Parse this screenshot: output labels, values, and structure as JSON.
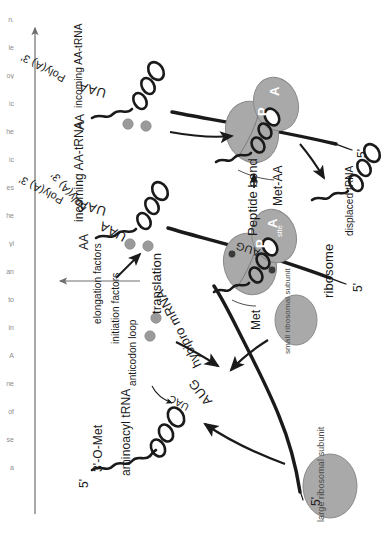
{
  "figure": {
    "domain": "biology-diagram",
    "orientation": "page scanned sideways; figure rotated 90 degrees counter-clockwise",
    "background_color": "#ffffff",
    "ink_color": "#1a1a1a",
    "blob_fill": "#a9a9a9",
    "blob_stroke": "#7d7d7d",
    "factor_dot_color": "#9a9a9a"
  },
  "process_arrow": {
    "label": "translation",
    "direction": "left-to-right, time progresses"
  },
  "panels": [
    {
      "id": "initiation",
      "name": "panel-initiation",
      "mrna": {
        "five_prime": "5'",
        "start_codon": "AUG",
        "name": "hybipro mRNA",
        "stop_codon": "UAA",
        "three_prime": "Poly(A) 3'"
      },
      "labels": [
        "5'",
        "3'-O-Met",
        "aminoacyl tRNA",
        "UAC",
        "anticodon",
        "loop",
        "large ribosomal subunit",
        "small ribosomal subunit",
        "initiation factors"
      ],
      "trna": {
        "acceptor_end": "3'-O-Met",
        "five_prime_end": "5'",
        "anticodon": "UAC",
        "anticodon_loop_label": "anticodon loop",
        "type": "aminoacyl tRNA"
      },
      "large_subunit_label": "large ribosomal subunit",
      "small_subunit_label": "small ribosomal subunit",
      "factors_label": "initiation factors"
    },
    {
      "id": "elongation-binding",
      "name": "panel-elongation-binding",
      "mrna": {
        "five_prime": "5'",
        "start_codon": "AUG",
        "stop_codon": "UAA",
        "three_prime": "Poly(A) 3'"
      },
      "labels": [
        "AA",
        "incoming AA-tRNA",
        "elongation factors",
        "Met",
        "ribosome",
        "P",
        "site",
        "A",
        "site",
        "5'"
      ],
      "ribosome_label": "ribosome",
      "p_site": {
        "letter": "P",
        "sub": "site"
      },
      "a_site": {
        "letter": "A",
        "sub": "site"
      },
      "incoming_label": "incoming AA-tRNA",
      "amino_acid_label": "AA",
      "met_label": "Met",
      "factors_label": "elongation factors"
    },
    {
      "id": "peptide-bond",
      "name": "panel-peptide-bond",
      "mrna": {
        "five_prime": "5'",
        "stop_codon": "UAA",
        "three_prime": "Poly(A) 3'"
      },
      "labels": [
        "AA",
        "incoming AA-tRNA",
        "Peptide bond",
        "Met-AA",
        "displaced tRNA",
        "P",
        "A",
        "5'"
      ],
      "peptide_bond_label": "Peptide bond",
      "dipeptide_label": "Met-AA",
      "displaced_label": "displaced tRNA",
      "incoming_label": "incoming AA-tRNA",
      "amino_acid_label": "AA",
      "p_site": {
        "letter": "P"
      },
      "a_site": {
        "letter": "A"
      }
    }
  ],
  "margin_fragments": [
    "n.",
    "le",
    "oy",
    "ic",
    "he",
    "ic",
    "es",
    "he",
    "yl",
    "an",
    "to",
    "in",
    "A",
    "ne",
    "of",
    "se",
    "a"
  ]
}
